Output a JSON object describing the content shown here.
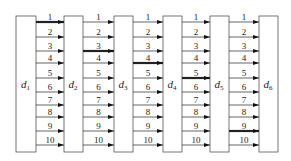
{
  "diagram": {
    "boxes": [
      {
        "label": "d",
        "sub": "1",
        "x": 16,
        "w": 20
      },
      {
        "label": "d",
        "sub": "2",
        "x": 64,
        "w": 19
      },
      {
        "label": "d",
        "sub": "3",
        "x": 114,
        "w": 19
      },
      {
        "label": "d",
        "sub": "4",
        "x": 163,
        "w": 19
      },
      {
        "label": "d",
        "sub": "5",
        "x": 210,
        "w": 19
      },
      {
        "label": "d",
        "sub": "6",
        "x": 259,
        "w": 19
      }
    ],
    "box_top": 16,
    "box_bottom": 152,
    "arrow_labels": [
      "1",
      "2",
      "3",
      "4",
      "5",
      "6",
      "7",
      "8",
      "9",
      "10"
    ],
    "arrow_y": [
      22,
      37,
      51,
      63,
      78,
      92,
      105,
      117,
      131,
      145
    ],
    "bold_arrows": [
      1,
      3,
      4,
      5,
      9
    ]
  }
}
